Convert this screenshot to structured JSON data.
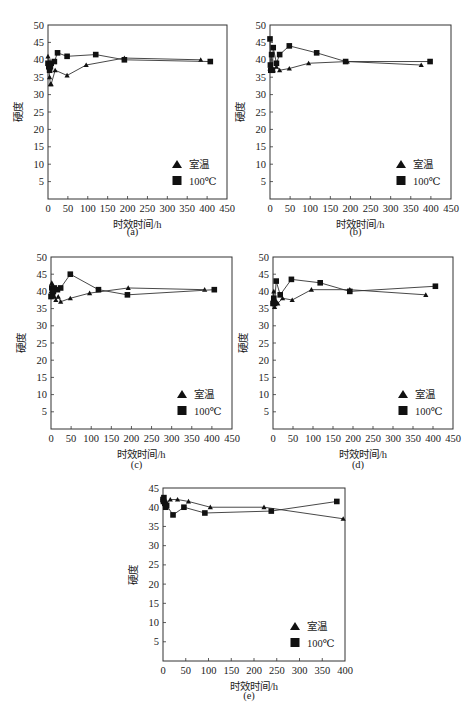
{
  "figure": {
    "panel_labels": [
      "(a)",
      "(b)",
      "(c)",
      "(d)",
      "(e)"
    ],
    "xlabel": "时效时间/h",
    "ylabel": "硬度",
    "legend": {
      "room_temp": "室温",
      "hundred_c": "100℃"
    }
  },
  "chart_data": [
    {
      "id": "a",
      "type": "line",
      "panel_label": "(a)",
      "xlabel": "时效时间/h",
      "ylabel": "硬度",
      "xlim": [
        0,
        450
      ],
      "ylim": [
        0,
        50
      ],
      "xticks": [
        0,
        50,
        100,
        150,
        200,
        250,
        300,
        350,
        400,
        450
      ],
      "yticks": [
        5,
        10,
        15,
        20,
        25,
        30,
        35,
        40,
        45,
        50
      ],
      "grid": false,
      "legend_position": "lower right",
      "series": [
        {
          "name": "室温",
          "marker": "triangle",
          "points": [
            [
              0,
              41
            ],
            [
              2,
              38
            ],
            [
              4,
              35
            ],
            [
              6,
              33
            ],
            [
              8,
              33
            ],
            [
              18,
              37
            ],
            [
              48,
              35.5
            ],
            [
              96,
              38.5
            ],
            [
              192,
              40.5
            ],
            [
              384,
              40
            ]
          ]
        },
        {
          "name": "100℃",
          "marker": "square",
          "points": [
            [
              0,
              39
            ],
            [
              2,
              38
            ],
            [
              4,
              37
            ],
            [
              6,
              38
            ],
            [
              8,
              39
            ],
            [
              16,
              39.5
            ],
            [
              24,
              42
            ],
            [
              48,
              41
            ],
            [
              120,
              41.5
            ],
            [
              192,
              40
            ],
            [
              408,
              39.5
            ]
          ]
        }
      ]
    },
    {
      "id": "b",
      "type": "line",
      "panel_label": "(b)",
      "xlabel": "时效时间/h",
      "ylabel": "硬度",
      "xlim": [
        0,
        450
      ],
      "ylim": [
        0,
        50
      ],
      "xticks": [
        0,
        50,
        100,
        150,
        200,
        250,
        300,
        350,
        400,
        450
      ],
      "yticks": [
        5,
        10,
        15,
        20,
        25,
        30,
        35,
        40,
        45,
        50
      ],
      "grid": false,
      "legend_position": "lower right",
      "series": [
        {
          "name": "室温",
          "marker": "triangle",
          "points": [
            [
              0,
              37.5
            ],
            [
              2,
              37
            ],
            [
              4,
              38
            ],
            [
              8,
              37
            ],
            [
              16,
              38
            ],
            [
              24,
              37
            ],
            [
              48,
              37.5
            ],
            [
              96,
              39
            ],
            [
              192,
              39.5
            ],
            [
              376,
              38.5
            ]
          ]
        },
        {
          "name": "100℃",
          "marker": "square",
          "points": [
            [
              0,
              46
            ],
            [
              1,
              38.5
            ],
            [
              2,
              37
            ],
            [
              4,
              41.5
            ],
            [
              6,
              37
            ],
            [
              8,
              43.5
            ],
            [
              16,
              39
            ],
            [
              24,
              41.5
            ],
            [
              48,
              44
            ],
            [
              116,
              42
            ],
            [
              188,
              39.5
            ],
            [
              398,
              39.5
            ]
          ]
        }
      ]
    },
    {
      "id": "c",
      "type": "line",
      "panel_label": "(c)",
      "xlabel": "时效时间/h",
      "ylabel": "硬度",
      "xlim": [
        0,
        450
      ],
      "ylim": [
        0,
        50
      ],
      "xticks": [
        0,
        50,
        100,
        150,
        200,
        250,
        300,
        350,
        400,
        450
      ],
      "yticks": [
        5,
        10,
        15,
        20,
        25,
        30,
        35,
        40,
        45,
        50
      ],
      "grid": false,
      "legend_position": "lower right",
      "series": [
        {
          "name": "室温",
          "marker": "triangle",
          "points": [
            [
              0,
              40
            ],
            [
              2,
              42.5
            ],
            [
              4,
              40
            ],
            [
              8,
              38.5
            ],
            [
              12,
              37.5
            ],
            [
              18,
              38.5
            ],
            [
              24,
              37
            ],
            [
              48,
              38
            ],
            [
              96,
              39.5
            ],
            [
              192,
              41
            ],
            [
              382,
              40.5
            ]
          ]
        },
        {
          "name": "100℃",
          "marker": "square",
          "points": [
            [
              0,
              38.5
            ],
            [
              2,
              41
            ],
            [
              4,
              39
            ],
            [
              6,
              40
            ],
            [
              8,
              41
            ],
            [
              16,
              40.5
            ],
            [
              24,
              41
            ],
            [
              48,
              45
            ],
            [
              118,
              40.5
            ],
            [
              190,
              39
            ],
            [
              406,
              40.5
            ]
          ]
        }
      ]
    },
    {
      "id": "d",
      "type": "line",
      "panel_label": "(d)",
      "xlabel": "时效时间/h",
      "ylabel": "硬度",
      "xlim": [
        0,
        450
      ],
      "ylim": [
        0,
        50
      ],
      "xticks": [
        0,
        50,
        100,
        150,
        200,
        250,
        300,
        350,
        400,
        450
      ],
      "yticks": [
        5,
        10,
        15,
        20,
        25,
        30,
        35,
        40,
        45,
        50
      ],
      "grid": false,
      "legend_position": "lower right",
      "series": [
        {
          "name": "室温",
          "marker": "triangle",
          "points": [
            [
              0,
              37
            ],
            [
              2,
              40
            ],
            [
              4,
              35.5
            ],
            [
              8,
              37
            ],
            [
              12,
              36.5
            ],
            [
              24,
              38
            ],
            [
              48,
              37.5
            ],
            [
              96,
              40.5
            ],
            [
              192,
              40.5
            ],
            [
              382,
              39
            ]
          ]
        },
        {
          "name": "100℃",
          "marker": "square",
          "points": [
            [
              0,
              36.5
            ],
            [
              2,
              38
            ],
            [
              4,
              36.5
            ],
            [
              8,
              43
            ],
            [
              18,
              39
            ],
            [
              46,
              43.5
            ],
            [
              118,
              42.5
            ],
            [
              192,
              40
            ],
            [
              406,
              41.5
            ]
          ]
        }
      ]
    },
    {
      "id": "e",
      "type": "line",
      "panel_label": "(e)",
      "xlabel": "时效时间/h",
      "ylabel": "硬度",
      "xlim": [
        0,
        400
      ],
      "ylim": [
        0,
        45
      ],
      "xticks": [
        0,
        50,
        100,
        150,
        200,
        250,
        300,
        350,
        400
      ],
      "yticks": [
        5,
        10,
        15,
        20,
        25,
        30,
        35,
        40,
        45
      ],
      "grid": false,
      "legend_position": "lower right",
      "series": [
        {
          "name": "室温",
          "marker": "triangle",
          "points": [
            [
              0,
              42.5
            ],
            [
              2,
              41.5
            ],
            [
              4,
              42
            ],
            [
              8,
              41
            ],
            [
              16,
              42
            ],
            [
              32,
              42
            ],
            [
              56,
              41.5
            ],
            [
              104,
              40
            ],
            [
              222,
              40
            ],
            [
              396,
              37
            ]
          ]
        },
        {
          "name": "100℃",
          "marker": "square",
          "points": [
            [
              0,
              42
            ],
            [
              1,
              41.5
            ],
            [
              2,
              42.5
            ],
            [
              4,
              41
            ],
            [
              6,
              40
            ],
            [
              8,
              40.5
            ],
            [
              22,
              38
            ],
            [
              46,
              40
            ],
            [
              92,
              38.5
            ],
            [
              238,
              39
            ],
            [
              382,
              41.5
            ]
          ]
        }
      ]
    }
  ]
}
